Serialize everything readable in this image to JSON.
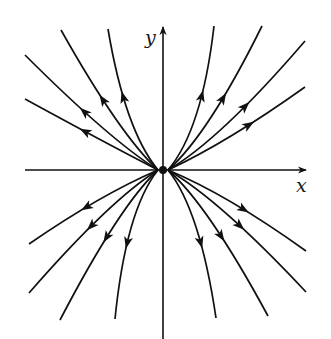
{
  "figure": {
    "type": "phase-portrait",
    "stroke_color": "#111111",
    "background": "#ffffff",
    "origin": [
      163,
      170
    ],
    "axes": {
      "x": {
        "label": "x",
        "from": [
          25,
          170
        ],
        "to": [
          306,
          170
        ],
        "label_pos": [
          296,
          192
        ]
      },
      "y": {
        "label": "y",
        "from": [
          163,
          340
        ],
        "to": [
          163,
          27
        ],
        "label_pos": [
          145,
          44
        ]
      }
    },
    "trajectories": [
      {
        "id": "ul-1",
        "start": [
          158,
          170
        ],
        "ctrl": [
          100,
          140
        ],
        "end": [
          25,
          99
        ],
        "arrow_t": 0.58
      },
      {
        "id": "ul-2",
        "start": [
          158,
          170
        ],
        "ctrl": [
          110,
          140
        ],
        "end": [
          25,
          55
        ],
        "arrow_t": 0.62
      },
      {
        "id": "ul-3",
        "start": [
          158,
          170
        ],
        "ctrl": [
          120,
          135
        ],
        "end": [
          61,
          30
        ],
        "arrow_t": 0.62
      },
      {
        "id": "ul-4",
        "start": [
          158,
          170
        ],
        "ctrl": [
          125,
          130
        ],
        "end": [
          108,
          29
        ],
        "arrow_t": 0.62
      },
      {
        "id": "ur-1",
        "start": [
          168,
          170
        ],
        "ctrl": [
          202,
          130
        ],
        "end": [
          214,
          26
        ],
        "arrow_t": 0.62
      },
      {
        "id": "ur-2",
        "start": [
          168,
          170
        ],
        "ctrl": [
          208,
          135
        ],
        "end": [
          262,
          26
        ],
        "arrow_t": 0.62
      },
      {
        "id": "ur-3",
        "start": [
          168,
          170
        ],
        "ctrl": [
          220,
          140
        ],
        "end": [
          305,
          41
        ],
        "arrow_t": 0.62
      },
      {
        "id": "ur-4",
        "start": [
          168,
          170
        ],
        "ctrl": [
          228,
          142
        ],
        "end": [
          305,
          87
        ],
        "arrow_t": 0.62
      },
      {
        "id": "ll-1",
        "start": [
          158,
          170
        ],
        "ctrl": [
          100,
          195
        ],
        "end": [
          29,
          244
        ],
        "arrow_t": 0.58
      },
      {
        "id": "ll-2",
        "start": [
          158,
          170
        ],
        "ctrl": [
          110,
          200
        ],
        "end": [
          29,
          293
        ],
        "arrow_t": 0.58
      },
      {
        "id": "ll-3",
        "start": [
          158,
          170
        ],
        "ctrl": [
          120,
          205
        ],
        "end": [
          60,
          320
        ],
        "arrow_t": 0.58
      },
      {
        "id": "ll-4",
        "start": [
          158,
          170
        ],
        "ctrl": [
          126,
          210
        ],
        "end": [
          115,
          319
        ],
        "arrow_t": 0.6
      },
      {
        "id": "lr-1",
        "start": [
          168,
          170
        ],
        "ctrl": [
          200,
          210
        ],
        "end": [
          216,
          318
        ],
        "arrow_t": 0.6
      },
      {
        "id": "lr-2",
        "start": [
          168,
          170
        ],
        "ctrl": [
          208,
          205
        ],
        "end": [
          268,
          316
        ],
        "arrow_t": 0.58
      },
      {
        "id": "lr-3",
        "start": [
          168,
          170
        ],
        "ctrl": [
          220,
          200
        ],
        "end": [
          306,
          292
        ],
        "arrow_t": 0.58
      },
      {
        "id": "lr-4",
        "start": [
          168,
          170
        ],
        "ctrl": [
          228,
          195
        ],
        "end": [
          306,
          251
        ],
        "arrow_t": 0.58
      }
    ]
  }
}
